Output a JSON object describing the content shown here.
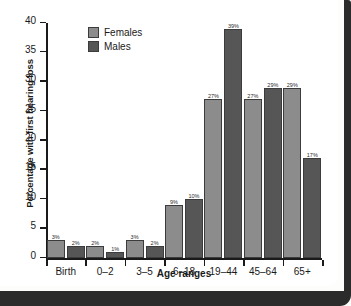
{
  "chart_data": {
    "type": "bar",
    "title": "",
    "xlabel": "Age ranges",
    "ylabel": "Percentage with first hearing loss",
    "categories": [
      "Birth",
      "0–2",
      "3–5",
      "6–18",
      "19–44",
      "45–64",
      "65+"
    ],
    "series": [
      {
        "name": "Females",
        "color": "#8c8c8c",
        "values": [
          3,
          2,
          3,
          9,
          27,
          27,
          29
        ],
        "labels": [
          "3%",
          "2%",
          "3%",
          "9%",
          "27%",
          "27%",
          "29%"
        ]
      },
      {
        "name": "Males",
        "color": "#565656",
        "values": [
          2,
          1,
          2,
          10,
          39,
          29,
          17
        ],
        "labels": [
          "2%",
          "1%",
          "2%",
          "10%",
          "39%",
          "29%",
          "17%"
        ]
      }
    ],
    "ylim": [
      0,
      40
    ],
    "yticks": [
      0,
      5,
      10,
      15,
      20,
      25,
      30,
      35,
      40
    ],
    "ytick_labels": [
      "0",
      "5",
      "10",
      "15",
      "20",
      "25",
      "30",
      "35",
      "40"
    ],
    "grid": false,
    "legend_position": "top-left"
  },
  "legend": {
    "entries": [
      {
        "label": "Females",
        "swatch": "#8c8c8c"
      },
      {
        "label": "Males",
        "swatch": "#565656"
      }
    ]
  }
}
